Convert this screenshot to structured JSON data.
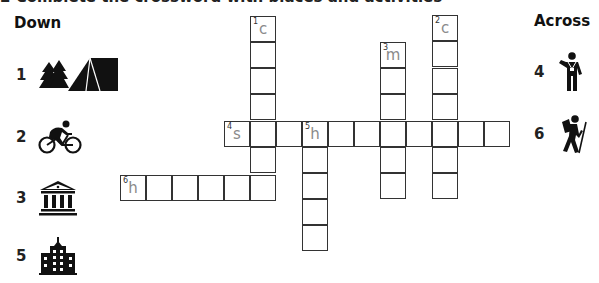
{
  "clipped_header": "2  Complete the crossword with places and activities",
  "down": {
    "heading": "Down",
    "clues": [
      {
        "number": "1",
        "icon": "camping-tent-trees-icon"
      },
      {
        "number": "2",
        "icon": "cycling-icon"
      },
      {
        "number": "3",
        "icon": "museum-building-icon"
      },
      {
        "number": "5",
        "icon": "hotel-building-icon"
      }
    ]
  },
  "across": {
    "heading": "Across",
    "clues": [
      {
        "number": "4",
        "icon": "sightseeing-tourist-camera-icon"
      },
      {
        "number": "6",
        "icon": "hiking-backpacker-icon"
      }
    ]
  },
  "crossword": {
    "cell_size": 26,
    "border_color": "#333333",
    "hint_letter_color": "#8a8a8a",
    "words": [
      {
        "id": "1-down",
        "number": "1",
        "direction": "down",
        "length": 7,
        "start_letter": "c"
      },
      {
        "id": "2-down",
        "number": "2",
        "direction": "down",
        "length": 7,
        "start_letter": "c"
      },
      {
        "id": "3-down",
        "number": "3",
        "direction": "down",
        "length": 6,
        "start_letter": "m"
      },
      {
        "id": "4-across",
        "number": "4",
        "direction": "across",
        "length": 11,
        "start_letter": "s"
      },
      {
        "id": "5-down",
        "number": "5",
        "direction": "down",
        "length": 5,
        "start_letter": "h"
      },
      {
        "id": "6-across",
        "number": "6",
        "direction": "across",
        "length": 6,
        "start_letter": "h"
      }
    ]
  }
}
